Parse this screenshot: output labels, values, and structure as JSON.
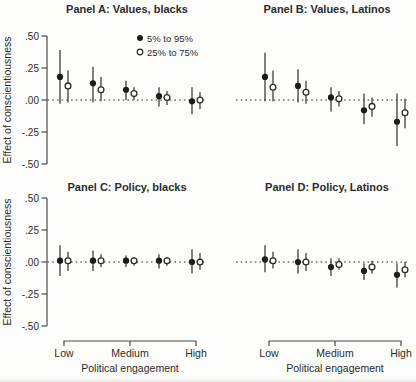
{
  "figure": {
    "width": 416,
    "height": 382,
    "ylabel": "Effect of conscientiousness",
    "y_tick_labels": [
      ".50",
      ".25",
      ".00",
      "-.25",
      "-.50"
    ],
    "y_tick_values": [
      0.5,
      0.25,
      0,
      -0.25,
      -0.5
    ],
    "colors": {
      "background": "#fdfdfb",
      "ink": "#2b2b2b",
      "axis": "#4a4a4a",
      "error_bar": "#4a4a4a",
      "marker_filled": "#1c1c1c",
      "marker_open_fill": "#ffffff"
    }
  },
  "legend": {
    "position": "top-right-panel-a",
    "items": [
      {
        "marker": "filled-circle",
        "label": "5% to 95%"
      },
      {
        "marker": "open-circle",
        "label": "25% to 75%"
      }
    ]
  },
  "chart_data": [
    {
      "type": "scatter",
      "panel": "A",
      "title": "Panel A: Values, blacks",
      "ylim": [
        -0.5,
        0.5
      ],
      "zero_line": true,
      "x_positions": [
        1,
        2,
        3,
        4,
        5
      ],
      "x_axis": {
        "label": "Political engagement",
        "tick_labels": [
          "Low",
          "Medium",
          "High"
        ],
        "tick_positions": [
          1,
          3,
          5
        ],
        "shown": false
      },
      "series": [
        {
          "name": "5% to 95%",
          "marker": "filled",
          "y": [
            0.18,
            0.13,
            0.08,
            0.03,
            -0.01
          ],
          "ci_low": [
            -0.03,
            -0.02,
            0.0,
            -0.05,
            -0.11
          ],
          "ci_high": [
            0.39,
            0.26,
            0.15,
            0.1,
            0.1
          ]
        },
        {
          "name": "25% to 75%",
          "marker": "open",
          "y": [
            0.11,
            0.08,
            0.05,
            0.02,
            0.0
          ],
          "ci_low": [
            -0.02,
            -0.01,
            0.0,
            -0.04,
            -0.07
          ],
          "ci_high": [
            0.23,
            0.18,
            0.1,
            0.07,
            0.06
          ]
        }
      ]
    },
    {
      "type": "scatter",
      "panel": "B",
      "title": "Panel B: Values, Latinos",
      "ylim": [
        -0.5,
        0.5
      ],
      "zero_line": true,
      "x_positions": [
        1,
        2,
        3,
        4,
        5
      ],
      "x_axis": {
        "label": "Political engagement",
        "tick_labels": [
          "Low",
          "Medium",
          "High"
        ],
        "tick_positions": [
          1,
          3,
          5
        ],
        "shown": false
      },
      "series": [
        {
          "name": "5% to 95%",
          "marker": "filled",
          "y": [
            0.18,
            0.11,
            0.02,
            -0.08,
            -0.17
          ],
          "ci_low": [
            -0.01,
            -0.02,
            -0.09,
            -0.19,
            -0.36
          ],
          "ci_high": [
            0.37,
            0.24,
            0.1,
            0.05,
            0.05
          ]
        },
        {
          "name": "25% to 75%",
          "marker": "open",
          "y": [
            0.1,
            0.06,
            0.01,
            -0.05,
            -0.1
          ],
          "ci_low": [
            -0.01,
            -0.03,
            -0.05,
            -0.13,
            -0.22
          ],
          "ci_high": [
            0.23,
            0.15,
            0.07,
            0.02,
            0.01
          ]
        }
      ]
    },
    {
      "type": "scatter",
      "panel": "C",
      "title": "Panel C: Policy, blacks",
      "ylim": [
        -0.5,
        0.5
      ],
      "zero_line": true,
      "x_positions": [
        1,
        2,
        3,
        4,
        5
      ],
      "x_axis": {
        "label": "Political engagement",
        "tick_labels": [
          "Low",
          "Medium",
          "High"
        ],
        "tick_positions": [
          1,
          3,
          5
        ],
        "shown": true
      },
      "series": [
        {
          "name": "5% to 95%",
          "marker": "filled",
          "y": [
            0.01,
            0.01,
            0.01,
            0.01,
            0.0
          ],
          "ci_low": [
            -0.11,
            -0.07,
            -0.04,
            -0.05,
            -0.09
          ],
          "ci_high": [
            0.13,
            0.09,
            0.05,
            0.06,
            0.1
          ]
        },
        {
          "name": "25% to 75%",
          "marker": "open",
          "y": [
            0.01,
            0.01,
            0.01,
            0.01,
            0.0
          ],
          "ci_low": [
            -0.07,
            -0.04,
            -0.03,
            -0.03,
            -0.06
          ],
          "ci_high": [
            0.08,
            0.06,
            0.04,
            0.04,
            0.07
          ]
        }
      ]
    },
    {
      "type": "scatter",
      "panel": "D",
      "title": "Panel D: Policy, Latinos",
      "ylim": [
        -0.5,
        0.5
      ],
      "zero_line": true,
      "x_positions": [
        1,
        2,
        3,
        4,
        5
      ],
      "x_axis": {
        "label": "Political engagement",
        "tick_labels": [
          "Low",
          "Medium",
          "High"
        ],
        "tick_positions": [
          1,
          3,
          5
        ],
        "shown": true
      },
      "series": [
        {
          "name": "5% to 95%",
          "marker": "filled",
          "y": [
            0.02,
            0.0,
            -0.04,
            -0.07,
            -0.1
          ],
          "ci_low": [
            -0.08,
            -0.09,
            -0.11,
            -0.14,
            -0.2
          ],
          "ci_high": [
            0.13,
            0.1,
            0.03,
            -0.01,
            -0.01
          ]
        },
        {
          "name": "25% to 75%",
          "marker": "open",
          "y": [
            0.01,
            0.0,
            -0.02,
            -0.04,
            -0.06
          ],
          "ci_low": [
            -0.05,
            -0.07,
            -0.06,
            -0.09,
            -0.12
          ],
          "ci_high": [
            0.08,
            0.07,
            0.03,
            0.01,
            0.0
          ]
        }
      ]
    }
  ]
}
